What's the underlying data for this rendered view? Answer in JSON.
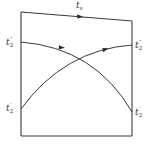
{
  "diagram": {
    "colors": {
      "stroke": "#3a3a3a",
      "arrow": "#2a2a2a",
      "label": "#333333",
      "background": "#ffffff"
    },
    "frame": {
      "top_left": [
        21,
        12
      ],
      "top_right": [
        132,
        21
      ],
      "bottom_right": [
        132,
        136
      ],
      "bottom_left": [
        21,
        136
      ]
    },
    "curves": [
      {
        "name": "falling-curve",
        "from": [
          21,
          42
        ],
        "to": [
          132,
          112
        ],
        "direction": "left-to-right"
      },
      {
        "name": "rising-curve",
        "from": [
          21,
          109
        ],
        "to": [
          132,
          45
        ],
        "direction": "left-to-right"
      }
    ],
    "labels": {
      "top_edge": {
        "base": "t",
        "sub": "s",
        "sup": ""
      },
      "left_upper": {
        "base": "t",
        "sub": "2",
        "sup": "″"
      },
      "left_lower": {
        "base": "t",
        "sub": "2",
        "sup": "′"
      },
      "right_upper": {
        "base": "t",
        "sub": "2",
        "sup": "″"
      },
      "right_lower": {
        "base": "t",
        "sub": "2",
        "sup": "′"
      }
    }
  }
}
